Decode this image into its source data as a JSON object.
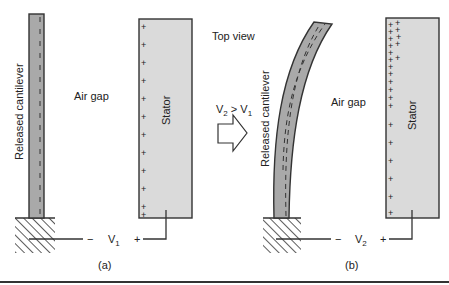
{
  "figure": {
    "top_label": "Top view",
    "transition_label_parts": {
      "v2": "V",
      "v2_sub": "2",
      "gt": " > ",
      "v1": "V",
      "v1_sub": "1"
    },
    "panel_a": {
      "caption": "(a)",
      "cantilever_label": "Released cantilever",
      "air_gap_label": "Air gap",
      "stator_label": "Stator",
      "voltage": {
        "name": "V",
        "sub": "1",
        "neg": "−",
        "pos": "+"
      },
      "stator_charge": "+",
      "stator_charge_count": 12
    },
    "panel_b": {
      "caption": "(b)",
      "cantilever_label": "Released cantilever",
      "air_gap_label": "Air gap",
      "stator_label": "Stator",
      "voltage": {
        "name": "V",
        "sub": "2",
        "neg": "−",
        "pos": "+"
      },
      "stator_charge": "+"
    },
    "colors": {
      "cantilever_fill": "#a9a9a9",
      "stator_fill": "#dadada",
      "stroke": "#333333",
      "rule": "#333333"
    }
  }
}
